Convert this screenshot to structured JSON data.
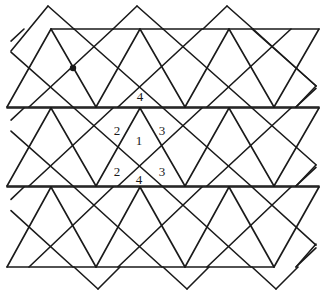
{
  "figure": {
    "stroke_color": "#1a1a1a",
    "stroke_width": 1.6,
    "background": "#ffffff",
    "bands": [
      {
        "top": 29,
        "bottom": 107,
        "h_top_from": 51,
        "h_bottom_from": 7
      },
      {
        "top": 108,
        "bottom": 186,
        "h_top_from": 7,
        "h_bottom_from": 7
      },
      {
        "top": 187,
        "bottom": 267,
        "h_top_from": 7,
        "h_bottom_from": 7
      }
    ],
    "right_edge_x": 319,
    "last_bottom_right_x": 274,
    "period_x": 89,
    "triangle_apex_x0": 51,
    "triangle_base_x0": 7,
    "square_top_apexes": [
      [
        48,
        6
      ],
      [
        137,
        6
      ],
      [
        227,
        6
      ]
    ],
    "square_bottom_corners": [
      [
        98,
        289
      ],
      [
        187,
        289
      ],
      [
        276,
        289
      ]
    ],
    "dot": {
      "x": 73,
      "y": 68,
      "r": 3.2
    },
    "labels": [
      {
        "text": "4",
        "x": 140,
        "y": 101
      },
      {
        "text": "2",
        "x": 117,
        "y": 135
      },
      {
        "text": "1",
        "x": 139,
        "y": 145
      },
      {
        "text": "3",
        "x": 162,
        "y": 135
      },
      {
        "text": "2",
        "x": 117,
        "y": 176
      },
      {
        "text": "4",
        "x": 139,
        "y": 184
      },
      {
        "text": "3",
        "x": 162,
        "y": 176
      }
    ]
  }
}
